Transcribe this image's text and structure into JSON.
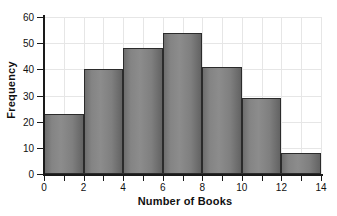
{
  "chart_data": {
    "type": "bar",
    "title": "",
    "subtitle": "",
    "xlabel": "Number of Books",
    "ylabel": "Frequency",
    "categories": [
      "0-2",
      "2-4",
      "4-6",
      "6-8",
      "8-10",
      "10-12",
      "12-14"
    ],
    "bin_edges": [
      0,
      2,
      4,
      6,
      8,
      10,
      12,
      14
    ],
    "values": [
      23,
      40,
      48,
      54,
      41,
      29,
      8
    ],
    "bin_width": 2,
    "xlim": [
      0,
      14
    ],
    "ylim": [
      0,
      60
    ],
    "x_ticks": [
      0,
      1,
      2,
      3,
      4,
      5,
      6,
      7,
      8,
      9,
      10,
      11,
      12,
      13,
      14
    ],
    "x_tick_labels": [
      "0",
      "",
      "2",
      "",
      "4",
      "",
      "6",
      "",
      "8",
      "",
      "10",
      "",
      "12",
      "",
      "14"
    ],
    "x_labeled_ticks": [
      0,
      2,
      4,
      6,
      8,
      10,
      12,
      14
    ],
    "y_ticks": [
      0,
      10,
      20,
      30,
      40,
      50,
      60
    ],
    "y_tick_labels": [
      "0",
      "10",
      "20",
      "30",
      "40",
      "50",
      "60"
    ],
    "grid": true,
    "grid_color": "#e6e6e6",
    "legend": null,
    "legend_position": "none",
    "bar_fill_color": "#808080",
    "bar_edge_color": "#2b2b2b",
    "axis_color": "#1a1a1a",
    "background_color": "#ffffff",
    "text_color": "#111111"
  }
}
